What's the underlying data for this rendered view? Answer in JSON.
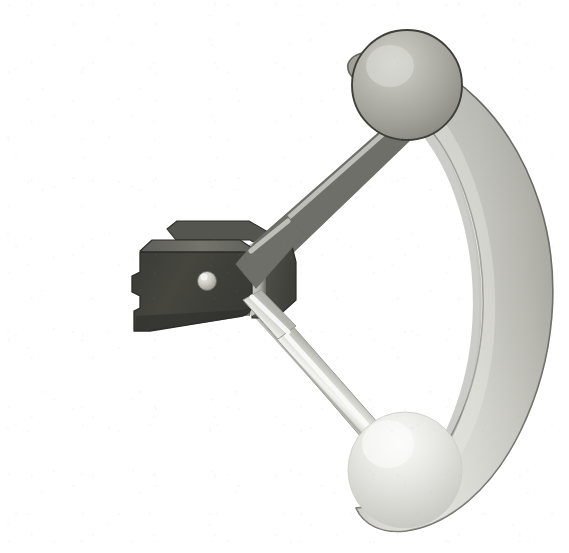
{
  "figure": {
    "title": "Mechanical control lever assembly",
    "background_color": "#ffffff",
    "width": 569,
    "height": 553
  },
  "palette": {
    "background": "#ffffff",
    "bracket_front": "#43433f",
    "bracket_front_dark": "#383834",
    "bracket_top_bevel": "#6e6e68",
    "bracket_side": "#4f4f4a",
    "bracket_back_slab": "#55554f",
    "bracket_edge_highlight": "#c9c9c2",
    "bracket_outline": "#2b2b28",
    "pin_light": "#d8d8d2",
    "pin_mid": "#a9a9a2",
    "pin_outline": "#6a6a64",
    "rod_upper_light": "#c8c8c2",
    "rod_upper_mid": "#9d9d96",
    "rod_upper_dark": "#7a7a74",
    "rod_lower_light": "#f2f2ef",
    "rod_lower_mid": "#cfcfca",
    "rod_lower_dark": "#a8a8a2",
    "sphere_top_light": "#c4c4bd",
    "sphere_top_mid": "#a3a39c",
    "sphere_top_dark": "#8a8a83",
    "sphere_top_outline": "#3f3f3a",
    "sphere_bottom_light": "#f4f4f1",
    "sphere_bottom_mid": "#dcdcd7",
    "sphere_bottom_dark": "#c3c3bd",
    "arc_light": "#deded9",
    "arc_mid": "#c3c3bd",
    "arc_dark": "#aeaea7",
    "arc_outline": "#6f6f69",
    "grain": "#9aa0a6"
  },
  "parts": [
    {
      "id": "bracket",
      "label": "Pivot bracket housing",
      "color": "#43433f",
      "notes": "Dark charcoal block with beveled top edge, stepped notch on the left face and a bright edge strip on the right"
    },
    {
      "id": "pin",
      "label": "Pivot pin",
      "color": "#d8d8d2",
      "notes": "Light circular boss centered on the bracket front face",
      "center_x": 207,
      "center_y": 281,
      "radius": 9
    },
    {
      "id": "upper-arm",
      "label": "Upper lever arm",
      "color": "#9d9d96",
      "notes": "Cylindrical rod angling up and to the right from the bracket to the upper ball knob"
    },
    {
      "id": "lower-arm",
      "label": "Lower lever arm",
      "color": "#cfcfca",
      "notes": "Lighter cylindrical rod angling down and to the right from the bracket to the lower ball knob"
    },
    {
      "id": "upper-ball",
      "label": "Upper ball knob",
      "color": "#a3a39c",
      "notes": "Medium gray shaded sphere with dark outline",
      "center_x": 407,
      "center_y": 85,
      "radius": 54
    },
    {
      "id": "lower-ball",
      "label": "Lower ball knob",
      "color": "#dcdcd7",
      "notes": "Very light shaded sphere blending into the arc band",
      "center_x": 405,
      "center_y": 470,
      "radius": 57
    },
    {
      "id": "guide-arc",
      "label": "Curved guide arc",
      "color": "#c3c3bd",
      "notes": "Crescent shaped band sweeping from behind the upper ball down past the lower ball"
    }
  ]
}
